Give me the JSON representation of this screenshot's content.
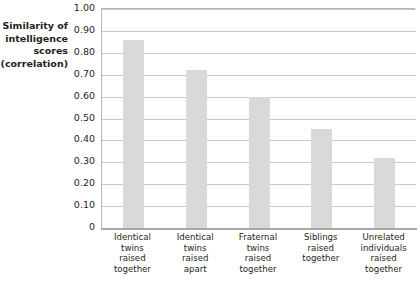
{
  "top_strip_text": "",
  "axis": {
    "y_title_lines": [
      "Similarity of",
      "intelligence",
      "scores",
      "(correlation)"
    ],
    "y_ticks": [
      "1.00",
      "0.90",
      "0.80",
      "0.70",
      "0.60",
      "0.50",
      "0.40",
      "0.30",
      "0.20",
      "0.10",
      "0"
    ]
  },
  "colors": {
    "bar_fill": "#d9d9d9",
    "grid": "#c9c9c9",
    "axis": "#a8a8a8",
    "text": "#231f20",
    "background": "#ffffff"
  },
  "chart_data": {
    "type": "bar",
    "title": "",
    "xlabel": "",
    "ylabel": "Similarity of intelligence scores (correlation)",
    "ylim": [
      0,
      1.0
    ],
    "ytick_step": 0.1,
    "grid": true,
    "legend": "none",
    "categories": [
      "Identical twins raised together",
      "Identical twins raised apart",
      "Fraternal twins raised together",
      "Siblings raised together",
      "Unrelated individuals raised together"
    ],
    "category_lines": [
      [
        "Identical",
        "twins",
        "raised",
        "together"
      ],
      [
        "Identical",
        "twins",
        "raised",
        "apart"
      ],
      [
        "Fraternal",
        "twins",
        "raised",
        "together"
      ],
      [
        "Siblings",
        "raised",
        "together"
      ],
      [
        "Unrelated",
        "individuals",
        "raised",
        "together"
      ]
    ],
    "values": [
      0.86,
      0.72,
      0.6,
      0.45,
      0.32
    ]
  }
}
